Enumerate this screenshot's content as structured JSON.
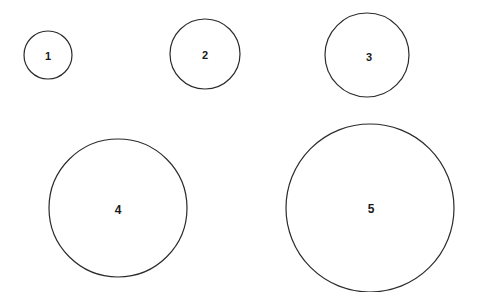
{
  "canvas": {
    "width": 477,
    "height": 292,
    "background_color": "#ffffff"
  },
  "style": {
    "stroke_color": "#2b2b2b",
    "stroke_width": 1.2,
    "fill_color": "#ffffff",
    "label_color": "#1a1a1a"
  },
  "chart_data": {
    "type": "scatter",
    "title": "",
    "subtitle": "",
    "xlabel": "",
    "ylabel": "",
    "grid": false,
    "legend": false,
    "axes_visible": false,
    "categories": [
      "1",
      "2",
      "3",
      "4",
      "5"
    ],
    "values": [
      24,
      35,
      42,
      69,
      84
    ],
    "value_units": "radius_px",
    "points": [
      {
        "label": "1",
        "cx": 48,
        "cy": 55,
        "r": 24,
        "label_x": 48,
        "label_y": 56,
        "label_font_size": 11
      },
      {
        "label": "2",
        "cx": 205,
        "cy": 54,
        "r": 35,
        "label_x": 205,
        "label_y": 55,
        "label_font_size": 11
      },
      {
        "label": "3",
        "cx": 367,
        "cy": 55,
        "r": 42,
        "label_x": 369,
        "label_y": 57,
        "label_font_size": 11
      },
      {
        "label": "4",
        "cx": 118,
        "cy": 208,
        "r": 69,
        "label_x": 118,
        "label_y": 210,
        "label_font_size": 12
      },
      {
        "label": "5",
        "cx": 370,
        "cy": 208,
        "r": 84,
        "label_x": 371,
        "label_y": 209,
        "label_font_size": 12
      }
    ]
  }
}
